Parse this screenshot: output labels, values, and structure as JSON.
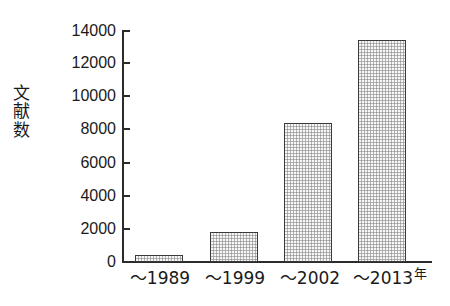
{
  "chart_data": {
    "type": "bar",
    "title": "",
    "subtitle": "",
    "xlabel": "年",
    "ylabel": "文献数",
    "ylabel_chars": [
      "文",
      "献",
      "数"
    ],
    "categories": [
      "～1989",
      "～1999",
      "～2002",
      "～2013"
    ],
    "values": [
      400,
      1800,
      8400,
      13400
    ],
    "series": [
      {
        "name": "文献数",
        "values": [
          400,
          1800,
          8400,
          13400
        ]
      }
    ],
    "ylim": [
      0,
      14000
    ],
    "y_ticks": [
      0,
      2000,
      4000,
      6000,
      8000,
      10000,
      12000,
      14000
    ],
    "y_tick_labels": [
      "0",
      "2000",
      "4000",
      "6000",
      "8000",
      "10000",
      "12000",
      "14000"
    ],
    "grid": false,
    "legend": false,
    "legend_position": "none",
    "x_unit_marker": "年",
    "bar_fill_color": "#cfcfcf",
    "bar_edge_color": "#3a3a3a",
    "axis_color": "#2b2b2b",
    "background_color": "#ffffff",
    "text_color": "#1a1a1a",
    "annotations": []
  }
}
